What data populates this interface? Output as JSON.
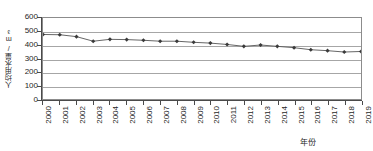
{
  "chart_data": {
    "type": "line",
    "title": "",
    "xlabel": "年份",
    "ylabel": "人均用水量/m³",
    "x": [
      2000,
      2001,
      2002,
      2003,
      2004,
      2005,
      2006,
      2007,
      2008,
      2009,
      2010,
      2011,
      2012,
      2013,
      2014,
      2015,
      2016,
      2017,
      2018,
      2019
    ],
    "categories": [
      "2000",
      "2001",
      "2002",
      "2003",
      "2004",
      "2005",
      "2006",
      "2007",
      "2008",
      "2009",
      "2010",
      "2011",
      "2012",
      "2013",
      "2014",
      "2015",
      "2016",
      "2017",
      "2018",
      "2019"
    ],
    "series": [
      {
        "name": "人均用水量",
        "values": [
          478,
          476,
          462,
          428,
          442,
          440,
          435,
          428,
          428,
          420,
          414,
          404,
          390,
          400,
          390,
          380,
          365,
          358,
          348,
          352
        ]
      }
    ],
    "ylim": [
      0,
      600
    ],
    "xlim": [
      2000,
      2019
    ],
    "yticks": [
      0,
      100,
      200,
      300,
      400,
      500,
      600
    ],
    "ytick_labels": [
      "0",
      "100",
      "200",
      "300",
      "400",
      "500",
      "600"
    ],
    "grid": true,
    "grid_axis": "y",
    "legend": false,
    "legend_position": "none",
    "marker": "diamond",
    "marker_color": "#3a3a3a",
    "line_color": "#555555",
    "gridline_color": "#a6a6a6",
    "axis_color": "#4a4a4a",
    "plot_background": "#ffffff",
    "annotations": []
  }
}
